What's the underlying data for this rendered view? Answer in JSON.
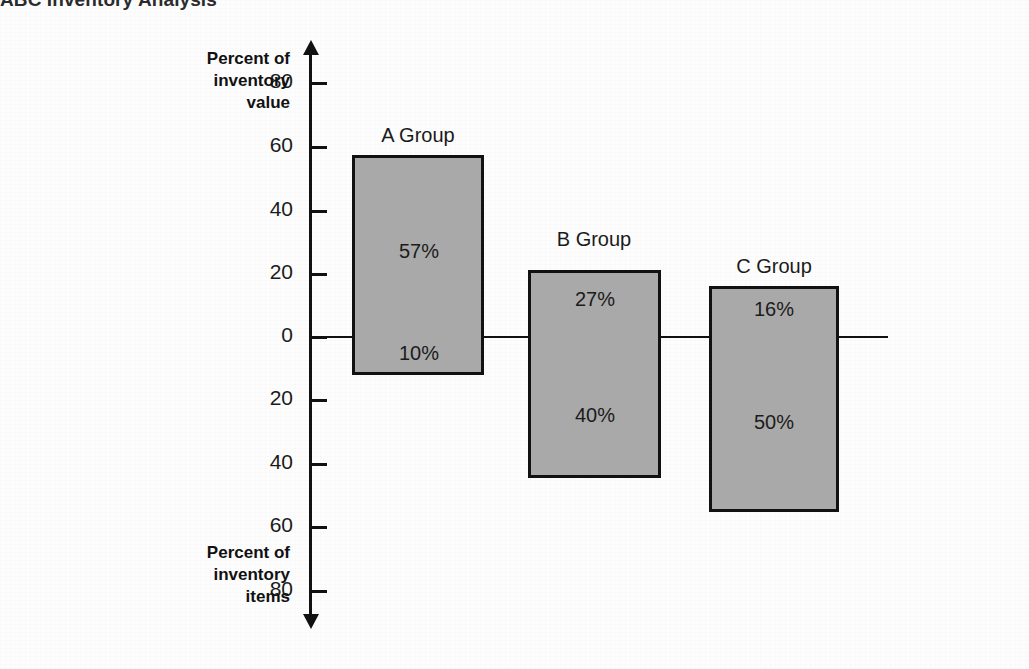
{
  "title": "ABC Inventory Analysis",
  "axis": {
    "upper_caption": "Percent of\ninventory\nvalue",
    "lower_caption": "Percent of\ninventory\nitems",
    "ticks": [
      {
        "label": "80",
        "y": 83,
        "value": 80
      },
      {
        "label": "60",
        "y": 147,
        "value": 60
      },
      {
        "label": "40",
        "y": 211,
        "value": 40
      },
      {
        "label": "20",
        "y": 274,
        "value": 20
      },
      {
        "label": "0",
        "y": 337,
        "value": 0
      },
      {
        "label": "20",
        "y": 400,
        "value": -20
      },
      {
        "label": "40",
        "y": 464,
        "value": -40
      },
      {
        "label": "60",
        "y": 527,
        "value": -60
      },
      {
        "label": "80",
        "y": 591,
        "value": -80
      }
    ]
  },
  "groups": [
    {
      "label": "A Group",
      "value_pct": "57%",
      "items_pct": "10%"
    },
    {
      "label": "B Group",
      "value_pct": "27%",
      "items_pct": "40%"
    },
    {
      "label": "C Group",
      "value_pct": "16%",
      "items_pct": "50%"
    }
  ],
  "colors": {
    "bar_fill": "#a9a9a9",
    "bar_border": "#111111",
    "axis": "#111111",
    "text": "#1b1b1b",
    "background": "#fdfdfd"
  },
  "chart_data": {
    "type": "bar",
    "title": "ABC Inventory Analysis",
    "xlabel": "",
    "ylabel": "Percent",
    "categories": [
      "A Group",
      "B Group",
      "C Group"
    ],
    "series": [
      {
        "name": "Percent of inventory value",
        "values": [
          57,
          27,
          16
        ],
        "direction": "up"
      },
      {
        "name": "Percent of inventory items",
        "values": [
          10,
          40,
          50
        ],
        "direction": "down"
      }
    ],
    "data_labels": [
      "57%",
      "27%",
      "16%",
      "10%",
      "40%",
      "50%"
    ],
    "ylim": [
      -80,
      80
    ],
    "ytick_labels": [
      "80",
      "60",
      "40",
      "20",
      "0",
      "20",
      "40",
      "60",
      "80"
    ],
    "grid": false,
    "legend": "none"
  }
}
